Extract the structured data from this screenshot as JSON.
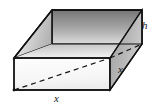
{
  "figure": {
    "type": "geometric-diagram",
    "shape": "open-top rectangular box",
    "labels": {
      "height": "h",
      "base_width": "x",
      "base_depth": "x"
    },
    "colors": {
      "outline": "#111111",
      "background": "#ffffff",
      "face_back_inner_dark": "#7d7d7d",
      "face_back_inner_light": "#d9d9d9",
      "face_left_inner_dark": "#bdbdbd",
      "face_left_inner_light": "#f2f2f2",
      "face_inner_floor_dark": "#c9c9c9",
      "face_inner_floor_light": "#efefef",
      "face_front_dark": "#e8e8e8",
      "face_front_light": "#ffffff",
      "face_right_dark": "#8e8e8e",
      "face_right_light": "#cfcfcf",
      "face_rim_top": "#b5b5b5"
    },
    "geometry": {
      "top_back_left": [
        52,
        10
      ],
      "top_back_right": [
        142,
        10
      ],
      "top_front_left": [
        14,
        58
      ],
      "top_front_right": [
        110,
        58
      ],
      "rim_inner_back_left": [
        57,
        14
      ],
      "rim_inner_back_right": [
        138,
        14
      ],
      "rim_inner_front_left": [
        19,
        55
      ],
      "rim_inner_front_right": [
        106,
        55
      ],
      "bottom_front_left": [
        14,
        90
      ],
      "bottom_front_right": [
        110,
        90
      ],
      "bottom_back_right": [
        142,
        44
      ],
      "hidden_back_left": [
        52,
        44
      ],
      "dashed_diagonal_start": [
        14,
        90
      ],
      "dashed_diagonal_end": [
        110,
        58
      ]
    }
  }
}
